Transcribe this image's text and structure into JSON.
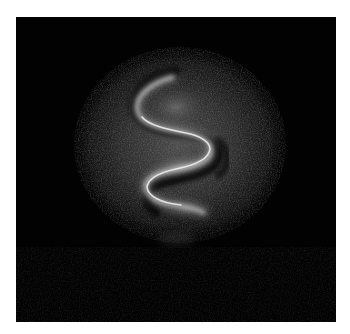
{
  "image": {
    "subject": "S-shaped bright curved structure within a faint circular glow on a black background",
    "colors": {
      "page_background": "#ffffff",
      "frame_background": "#020202",
      "glow": "#6a6a6a",
      "curve": "#e8e8e8",
      "shadow": "#000000"
    }
  }
}
